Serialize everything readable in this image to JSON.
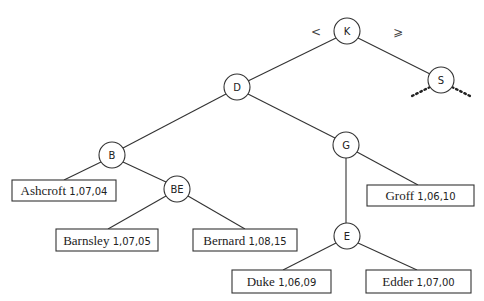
{
  "diagram": {
    "type": "binary-search-tree",
    "edge_labels": {
      "left": "<",
      "right": "⩾"
    },
    "internal_nodes": [
      {
        "id": "K",
        "label": "K",
        "x": 347,
        "y": 31,
        "r": 13
      },
      {
        "id": "S",
        "label": "S",
        "x": 441,
        "y": 80,
        "r": 13
      },
      {
        "id": "D",
        "label": "D",
        "x": 237,
        "y": 87,
        "r": 13
      },
      {
        "id": "B",
        "label": "B",
        "x": 112,
        "y": 155,
        "r": 13
      },
      {
        "id": "BE",
        "label": "BE",
        "x": 177,
        "y": 189,
        "r": 13
      },
      {
        "id": "G",
        "label": "G",
        "x": 346,
        "y": 145,
        "r": 13
      },
      {
        "id": "E",
        "label": "E",
        "x": 347,
        "y": 236,
        "r": 13
      }
    ],
    "leaves": [
      {
        "id": "ashcroft",
        "name": "Ashcroft",
        "code": "1,07,04",
        "x": 12,
        "y": 180,
        "w": 104,
        "h": 21
      },
      {
        "id": "barnsley",
        "name": "Barnsley",
        "code": "1,07,05",
        "x": 56,
        "y": 229,
        "w": 102,
        "h": 22
      },
      {
        "id": "bernard",
        "name": "Bernard",
        "code": "1,08,15",
        "x": 193,
        "y": 229,
        "w": 104,
        "h": 22
      },
      {
        "id": "groff",
        "name": "Groff",
        "code": "1,06,10",
        "x": 367,
        "y": 185,
        "w": 107,
        "h": 21
      },
      {
        "id": "duke",
        "name": "Duke",
        "code": "1,06,09",
        "x": 232,
        "y": 270,
        "w": 99,
        "h": 23
      },
      {
        "id": "edder",
        "name": "Edder",
        "code": "1,07,00",
        "x": 366,
        "y": 270,
        "w": 105,
        "h": 23
      }
    ],
    "edges": [
      {
        "from": "K",
        "to": "D",
        "x1": 336,
        "y1": 38,
        "x2": 248,
        "y2": 81
      },
      {
        "from": "K",
        "to": "S",
        "x1": 358,
        "y1": 38,
        "x2": 430,
        "y2": 74
      },
      {
        "from": "D",
        "to": "B",
        "x1": 226,
        "y1": 94,
        "x2": 123,
        "y2": 148
      },
      {
        "from": "D",
        "to": "G",
        "x1": 248,
        "y1": 94,
        "x2": 335,
        "y2": 138
      },
      {
        "from": "B",
        "to": "Ashcroft",
        "x1": 101,
        "y1": 162,
        "x2": 64,
        "y2": 180
      },
      {
        "from": "B",
        "to": "BE",
        "x1": 123,
        "y1": 162,
        "x2": 166,
        "y2": 182
      },
      {
        "from": "BE",
        "to": "Barnsley",
        "x1": 166,
        "y1": 196,
        "x2": 108,
        "y2": 229
      },
      {
        "from": "BE",
        "to": "Bernard",
        "x1": 188,
        "y1": 196,
        "x2": 245,
        "y2": 229
      },
      {
        "from": "G",
        "to": "E",
        "x1": 346,
        "y1": 158,
        "x2": 346,
        "y2": 223
      },
      {
        "from": "G",
        "to": "Groff",
        "x1": 357,
        "y1": 152,
        "x2": 418,
        "y2": 185
      },
      {
        "from": "E",
        "to": "Duke",
        "x1": 336,
        "y1": 243,
        "x2": 283,
        "y2": 270
      },
      {
        "from": "E",
        "to": "Edder",
        "x1": 358,
        "y1": 243,
        "x2": 417,
        "y2": 270
      }
    ],
    "continuation_dots": [
      {
        "from": "S",
        "side": "left",
        "x1": 430,
        "y1": 87,
        "x2": 410,
        "y2": 97
      },
      {
        "from": "S",
        "side": "right",
        "x1": 452,
        "y1": 87,
        "x2": 472,
        "y2": 97
      }
    ],
    "colors": {
      "stroke": "#333333",
      "text": "#222222",
      "background": "#ffffff"
    }
  }
}
